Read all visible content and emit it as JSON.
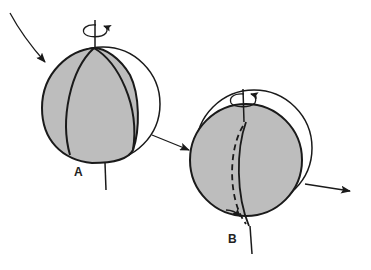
{
  "diagram": {
    "colors": {
      "fill": "#bdbdbd",
      "stroke": "#1a1a1a",
      "background": "#ffffff"
    },
    "spheres": [
      {
        "id": "A",
        "label": "A"
      },
      {
        "id": "B",
        "label": "B"
      }
    ],
    "arrows": [
      {
        "name": "incoming-arrow-a",
        "from": "top-left",
        "to": "sphere A"
      },
      {
        "name": "transition-arrow",
        "from": "sphere A",
        "to": "sphere B"
      },
      {
        "name": "outgoing-arrow-b",
        "from": "sphere B",
        "to": "right"
      }
    ]
  }
}
